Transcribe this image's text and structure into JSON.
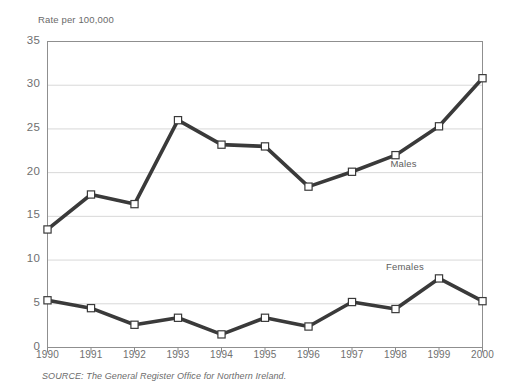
{
  "figure": {
    "title_remnant": "",
    "source_note": "SOURCE: The General Register Office for Northern Ireland."
  },
  "chart_data": {
    "type": "line",
    "title": "",
    "subtitle": "",
    "xlabel": "",
    "ylabel": "Rate per 100,000",
    "categories": [
      "1990",
      "1991",
      "1992",
      "1993",
      "1994",
      "1995",
      "1996",
      "1997",
      "1998",
      "1999",
      "2000"
    ],
    "x": [
      1990,
      1991,
      1992,
      1993,
      1994,
      1995,
      1996,
      1997,
      1998,
      1999,
      2000
    ],
    "series": [
      {
        "name": "Males",
        "values": [
          13.5,
          17.5,
          16.4,
          26.0,
          23.2,
          23.0,
          18.4,
          20.1,
          22.0,
          25.3,
          30.8
        ],
        "color": "#3a3a3a",
        "marker": "square"
      },
      {
        "name": "Females",
        "values": [
          5.4,
          4.5,
          2.6,
          3.4,
          1.5,
          3.4,
          2.4,
          5.2,
          4.4,
          7.9,
          5.3
        ],
        "color": "#3a3a3a",
        "marker": "square"
      }
    ],
    "ylim": [
      0,
      35
    ],
    "yticks": [
      0,
      5,
      10,
      15,
      20,
      25,
      30,
      35
    ],
    "ytick_labels": [
      "0",
      "5",
      "10",
      "15",
      "20",
      "25",
      "30",
      "35"
    ],
    "grid": "horizontal",
    "legend": "inline-annotations",
    "annotations": [
      {
        "text": "Males",
        "x": 1998.25,
        "y": 20.9
      },
      {
        "text": "Females",
        "x": 1998.15,
        "y": 9.1
      }
    ],
    "colors": {
      "line": "#3a3a3a",
      "marker_fill": "#ffffff",
      "grid": "#d8d8d8",
      "axis": "#8a8a8a",
      "text": "#6f6f6f"
    }
  }
}
